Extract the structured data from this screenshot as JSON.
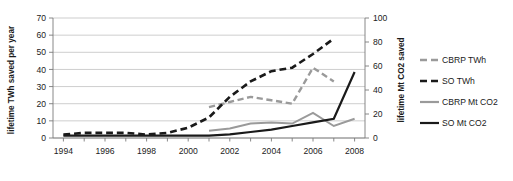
{
  "chart_data": {
    "type": "line",
    "title": "",
    "xlabel": "",
    "ylabel": "lifetime TWh saved per year",
    "y2label": "lifetime Mt CO2 saved",
    "x": [
      1994,
      1995,
      1996,
      1997,
      1998,
      1999,
      2000,
      2001,
      2002,
      2003,
      2004,
      2005,
      2006,
      2007,
      2008
    ],
    "xlim": [
      1993.5,
      2008.5
    ],
    "ylim": [
      0,
      70
    ],
    "y2lim": [
      0,
      100
    ],
    "xticks": [
      1994,
      1996,
      1998,
      2000,
      2002,
      2004,
      2006,
      2008
    ],
    "xtick_labels": [
      "1994",
      "1996",
      "1998",
      "2000",
      "2002",
      "2004",
      "2006",
      "2008"
    ],
    "yticks": [
      0,
      10,
      20,
      30,
      40,
      50,
      60,
      70
    ],
    "ytick_labels": [
      "0",
      "10",
      "20",
      "30",
      "40",
      "50",
      "60",
      "70"
    ],
    "y2ticks": [
      0,
      20,
      40,
      60,
      80,
      100
    ],
    "y2tick_labels": [
      "0",
      "20",
      "40",
      "60",
      "80",
      "100"
    ],
    "grid": true,
    "legend_position": "right",
    "series": [
      {
        "name": "CBRP TWh",
        "axis": "left",
        "color": "#9a9a9a",
        "style": "dashed",
        "width": 2.4,
        "x": [
          2001,
          2002,
          2003,
          2004,
          2005,
          2006,
          2007
        ],
        "values": [
          18,
          21,
          24,
          22,
          20,
          41,
          33
        ]
      },
      {
        "name": "SO TWh",
        "axis": "left",
        "color": "#1a1a1a",
        "style": "dashed",
        "width": 2.6,
        "x": [
          1994,
          1995,
          1996,
          1997,
          1998,
          1999,
          2000,
          2001,
          2002,
          2003,
          2004,
          2005,
          2006,
          2007
        ],
        "values": [
          2,
          3,
          3,
          3,
          2,
          3,
          6,
          12,
          24,
          33,
          39,
          41,
          49,
          58
        ]
      },
      {
        "name": "CBRP Mt CO2",
        "axis": "right",
        "color": "#9a9a9a",
        "style": "solid",
        "width": 2.0,
        "x": [
          2001,
          2002,
          2003,
          2004,
          2005,
          2006,
          2007,
          2008
        ],
        "values": [
          6,
          8,
          12,
          13,
          12,
          21,
          10,
          16
        ]
      },
      {
        "name": "SO Mt CO2",
        "axis": "right",
        "color": "#1a1a1a",
        "style": "solid",
        "width": 2.2,
        "x": [
          1994,
          1995,
          1996,
          1997,
          1998,
          1999,
          2000,
          2001,
          2002,
          2003,
          2004,
          2005,
          2006,
          2007,
          2008
        ],
        "values": [
          2,
          2,
          2,
          2,
          2,
          2,
          2,
          2,
          3,
          5,
          7,
          10,
          13,
          16,
          55
        ]
      }
    ],
    "legend": [
      {
        "label": "CBRP TWh",
        "color": "#9a9a9a",
        "style": "dashed"
      },
      {
        "label": "SO TWh",
        "color": "#1a1a1a",
        "style": "dashed"
      },
      {
        "label": "CBRP Mt CO2",
        "color": "#9a9a9a",
        "style": "solid"
      },
      {
        "label": "SO Mt CO2",
        "color": "#1a1a1a",
        "style": "solid"
      }
    ]
  }
}
